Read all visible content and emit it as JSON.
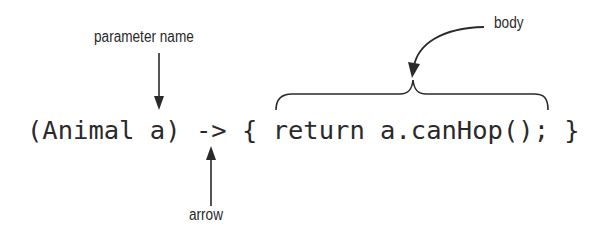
{
  "diagram": {
    "code": "(Animal a) -> { return a.canHop(); }",
    "labels": {
      "parameter_name": "parameter name",
      "body": "body",
      "arrow": "arrow"
    },
    "colors": {
      "ink": "#2a2a2a",
      "background": "#ffffff"
    }
  }
}
